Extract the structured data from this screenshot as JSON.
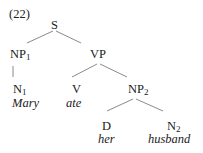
{
  "example_number": "(22)",
  "tree": {
    "S": "S",
    "NP1": {
      "label": "NP",
      "sub": "1"
    },
    "VP": "VP",
    "N1": {
      "label": "N",
      "sub": "1",
      "word": "Mary"
    },
    "V": {
      "label": "V",
      "word": "ate"
    },
    "NP2": {
      "label": "NP",
      "sub": "2"
    },
    "D": {
      "label": "D",
      "word": "her"
    },
    "N2": {
      "label": "N",
      "sub": "2",
      "word": "husband"
    }
  },
  "colors": {
    "text": "#222222",
    "lines": "#888888"
  }
}
